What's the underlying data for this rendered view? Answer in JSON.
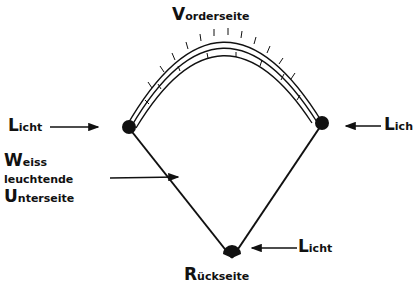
{
  "diagram": {
    "labels": {
      "front": {
        "cap": "V",
        "rest": "orderseite"
      },
      "back": {
        "cap": "R",
        "rest": "ückseite"
      },
      "light_left": {
        "cap": "L",
        "rest": "icht"
      },
      "light_right": {
        "cap": "L",
        "rest": "ich"
      },
      "light_bottom": {
        "cap": "L",
        "rest": "icht"
      },
      "underside_line1": {
        "cap": "W",
        "rest": "eiss"
      },
      "underside_line2": "leuchtende",
      "underside_line3": {
        "cap": "U",
        "rest": "nterseite"
      }
    },
    "colors": {
      "ink": "#111111",
      "background": "#ffffff"
    }
  }
}
